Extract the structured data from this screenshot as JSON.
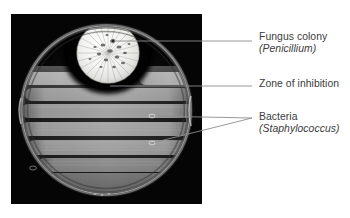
{
  "figure": {
    "type": "labeled-photograph",
    "background_color": "#ffffff",
    "photo": {
      "name": "petri-dish-photograph",
      "background_color": "#050505",
      "x": 11,
      "y": 14,
      "width": 191,
      "height": 190
    }
  },
  "labels": [
    {
      "id": "fungus",
      "name": "Fungus colony",
      "scientific": "(Penicillium)",
      "text_color": "#3b3b3b",
      "leader": {
        "from_x": 113,
        "from_y": 41,
        "to_x": 252,
        "to_y": 41
      },
      "marker": {
        "x": 113,
        "y": 41,
        "kind": "dot"
      }
    },
    {
      "id": "zone",
      "name": "Zone of inhibition",
      "scientific": "",
      "text_color": "#3b3b3b",
      "leader": {
        "from_x": 110,
        "from_y": 86,
        "to_x": 252,
        "to_y": 86
      },
      "marker": {
        "x": 110,
        "y": 86,
        "kind": "none"
      }
    },
    {
      "id": "bacteria",
      "name": "Bacteria",
      "scientific": "(Staphylococcus)",
      "text_color": "#3b3b3b",
      "leader": {
        "from_x": 152,
        "from_y": 116,
        "to_x": 252,
        "to_y": 118
      },
      "leader2": {
        "from_x": 152,
        "from_y": 143,
        "to_x": 252,
        "to_y": 118
      },
      "marker": {
        "x": 152,
        "y": 116,
        "kind": "ellipse"
      },
      "marker2": {
        "x": 152,
        "y": 143,
        "kind": "ellipse"
      }
    }
  ],
  "specimen": {
    "dish": {
      "name": "petri-dish",
      "center_x": 106,
      "center_y": 110,
      "radius": 86,
      "rim_color": "#9a9a9a"
    },
    "colony": {
      "name": "fungus-colony",
      "center_x": 108,
      "center_y": 53,
      "radius_x": 30,
      "radius_y": 29,
      "color": "#f2f2f0",
      "halo_color": "#000000"
    },
    "streaks": {
      "name": "bacteria-streaks",
      "count": 7,
      "color": "#8e8e8e",
      "orientation": "horizontal"
    }
  }
}
